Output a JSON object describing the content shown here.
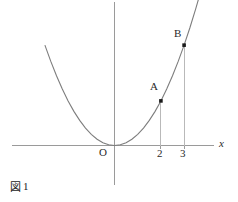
{
  "figure": {
    "caption_glyph": "図",
    "caption_number": "1",
    "caption_full": "図1"
  },
  "axes": {
    "x_axis_label": "x",
    "y_axis_label": "",
    "origin_label": "O",
    "x_ticks": [
      "2",
      "3"
    ],
    "colors": {
      "axis": "#9a9a9a",
      "curve": "#7d7d7d",
      "drop_line": "#b9b9b9",
      "marker": "#1a1a1a",
      "background": "#ffffff"
    }
  },
  "points": [
    {
      "label": "A",
      "x_value": "2"
    },
    {
      "label": "B",
      "x_value": "3"
    }
  ],
  "chart_data": {
    "type": "line",
    "title": "",
    "subtitle": "",
    "xlabel": "x",
    "ylabel": "",
    "grid": false,
    "legend_position": "none",
    "xlim": [
      -3.2,
      4.3
    ],
    "ylim": [
      0,
      9.2
    ],
    "x_tick_labels": [
      "2",
      "3"
    ],
    "x_tick_values": [
      2,
      3
    ],
    "y_tick_labels": [],
    "y_tick_values": [],
    "origin_label": "O",
    "series": [
      {
        "name": "y = x^2",
        "type": "curve",
        "x": [
          -3.0,
          -2.75,
          -2.5,
          -2.25,
          -2.0,
          -1.75,
          -1.5,
          -1.25,
          -1.0,
          -0.75,
          -0.5,
          -0.25,
          0.0,
          0.25,
          0.5,
          0.75,
          1.0,
          1.25,
          1.5,
          1.75,
          2.0,
          2.25,
          2.5,
          2.75,
          3.0,
          3.25,
          3.5,
          3.75
        ],
        "y": [
          9.0,
          7.5625,
          6.25,
          5.0625,
          4.0,
          3.0625,
          2.25,
          1.5625,
          1.0,
          0.5625,
          0.25,
          0.0625,
          0.0,
          0.0625,
          0.25,
          0.5625,
          1.0,
          1.5625,
          2.25,
          3.0625,
          4.0,
          5.0625,
          6.25,
          7.5625,
          9.0,
          10.5625,
          12.25,
          14.0625
        ]
      }
    ],
    "annotations": [
      {
        "label": "A",
        "x": 2,
        "y": 4,
        "marker": true,
        "drop_line": true
      },
      {
        "label": "B",
        "x": 3,
        "y": 9,
        "marker": true,
        "drop_line": true
      }
    ]
  }
}
